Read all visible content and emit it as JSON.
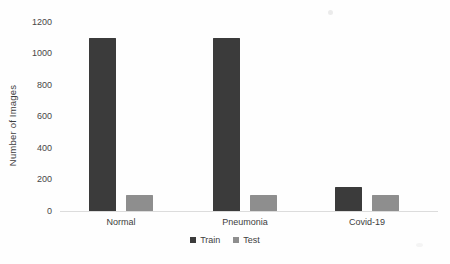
{
  "chart_data": {
    "type": "bar",
    "title": "",
    "xlabel": "",
    "ylabel": "Number of Images",
    "categories": [
      "Normal",
      "Pneumonia",
      "Covid-19"
    ],
    "series": [
      {
        "name": "Train",
        "color": "#3b3b3b",
        "values": [
          1100,
          1100,
          150
        ]
      },
      {
        "name": "Test",
        "color": "#8e8e8e",
        "values": [
          100,
          100,
          100
        ]
      }
    ],
    "ylim": [
      0,
      1200
    ],
    "ytick_step": 200,
    "ytick_labels": [
      "0",
      "200",
      "400",
      "600",
      "800",
      "1000",
      "1200"
    ],
    "grid": false,
    "legend_position": "bottom",
    "axis_line_color": "#dcdcdc",
    "background_color": "#fefefe"
  }
}
